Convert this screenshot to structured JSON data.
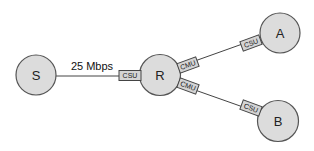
{
  "diagram": {
    "nodes": [
      {
        "id": "S",
        "label": "S"
      },
      {
        "id": "R",
        "label": "R"
      },
      {
        "id": "A",
        "label": "A"
      },
      {
        "id": "B",
        "label": "B"
      }
    ],
    "links": [
      {
        "from": "S",
        "to": "R",
        "label": "25 Mbps"
      },
      {
        "from": "R",
        "to": "A",
        "label": ""
      },
      {
        "from": "R",
        "to": "B",
        "label": ""
      }
    ],
    "devices": [
      {
        "id": "csu-r-s",
        "label": "CSU",
        "near": "R",
        "link": "S-R"
      },
      {
        "id": "cmu-r-a",
        "label": "CMU",
        "near": "R",
        "link": "R-A"
      },
      {
        "id": "cmu-r-b",
        "label": "CMU",
        "near": "R",
        "link": "R-B"
      },
      {
        "id": "csu-a",
        "label": "CSU",
        "near": "A",
        "link": "R-A"
      },
      {
        "id": "csu-b",
        "label": "CSU",
        "near": "B",
        "link": "R-B"
      }
    ]
  },
  "colors": {
    "node_fill": "#dcdcdc",
    "stroke": "#444444",
    "device_fill": "#d4d4d4"
  }
}
